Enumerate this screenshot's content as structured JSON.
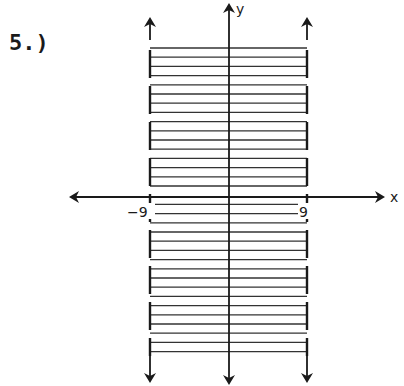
{
  "problem": {
    "label": "5.)"
  },
  "chart_data": {
    "type": "region",
    "title": "",
    "inequality": "-9 < x < 9",
    "xlabel": "x",
    "ylabel": "y",
    "tick_labels": [
      {
        "axis": "x",
        "value": -9,
        "label": "−9"
      },
      {
        "axis": "x",
        "value": 9,
        "label": "9"
      }
    ],
    "boundaries": [
      {
        "x": -9,
        "style": "dashed",
        "arrows": "both"
      },
      {
        "x": 9,
        "style": "dashed",
        "arrows": "both"
      }
    ],
    "shading": {
      "between": [
        -9,
        9
      ],
      "pattern": "horizontal-hatch"
    },
    "grid": false,
    "legend": null
  },
  "axes": {
    "x_label": "x",
    "y_label": "y",
    "neg_tick": "−9",
    "pos_tick": "9"
  },
  "colors": {
    "ink": "#1a1a1a",
    "background": "#ffffff"
  }
}
